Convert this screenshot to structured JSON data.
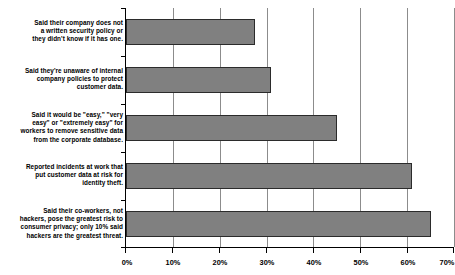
{
  "chart_data": {
    "type": "bar",
    "orientation": "horizontal",
    "title": "",
    "subtitle": "",
    "xlabel": "",
    "ylabel": "",
    "xlim": [
      0,
      70
    ],
    "xticks": [
      0,
      10,
      20,
      30,
      40,
      50,
      60,
      70
    ],
    "xticklabels": [
      "0%",
      "10%",
      "20%",
      "30%",
      "40%",
      "50%",
      "60%",
      "70%"
    ],
    "grid": true,
    "grid_axis": "x",
    "legend": false,
    "bar_color": "#808080",
    "bar_edge_color": "#2b2b2b",
    "axis_color": "#000000",
    "gridline_color": "#8c8c8c",
    "background": "#ffffff",
    "categories": [
      "Said their company does not a written security policy or they didn't know if it has one.",
      "Said they're unaware of internal company policies to protect customer data.",
      "Said it would be \"easy,\" \"very easy\" or \"extremely easy\" for workers to remove sensitive data from the corporate database.",
      "Reported incidents at work that put customer data at risk for identity theft.",
      "Said their co-workers, not hackers, pose the greatest risk to consumer privacy; only 10% said hackers are the greatest threat."
    ],
    "category_lines": [
      [
        "Said their company does not",
        "a written security policy or",
        "they didn't know if it has one."
      ],
      [
        "Said they're unaware of internal",
        "company policies to protect",
        "customer data."
      ],
      [
        "Said it would be \"easy,\" \"very",
        "easy\" or \"extremely easy\" for",
        "workers to remove sensitive data",
        "from the corporate database."
      ],
      [
        "Reported incidents at work that",
        "put customer data at risk for",
        "identity theft."
      ],
      [
        "Said their co-workers, not",
        "hackers, pose the greatest risk to",
        "consumer privacy; only 10% said",
        "hackers are the greatest threat."
      ]
    ],
    "values": [
      27.5,
      31,
      45,
      61,
      65
    ],
    "value_labels": [
      "27.5%",
      "31%",
      "45%",
      "61%",
      "65%"
    ]
  }
}
